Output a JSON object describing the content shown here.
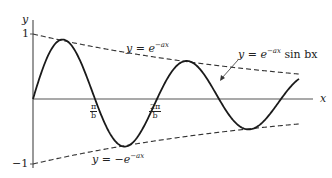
{
  "axes": {
    "x_label": "x",
    "y_label": "y",
    "y_ticks": [
      {
        "value": 1,
        "label": "1"
      },
      {
        "value": -1,
        "label": "−1"
      }
    ],
    "x_ticks": [
      {
        "num": "π",
        "den": "b"
      },
      {
        "num": "2π",
        "den": "b"
      }
    ]
  },
  "curves": {
    "upper_envelope": {
      "prefix": "y = e",
      "exp": "−ax"
    },
    "lower_envelope": {
      "prefix": "y = −e",
      "exp": "−ax"
    },
    "main_curve": {
      "prefix": "y = e",
      "exp": "−ax",
      "suffix": " sin bx"
    }
  },
  "colors": {
    "line": "#222222",
    "axis": "#555555",
    "background": "#ffffff"
  },
  "chart_data": {
    "type": "line",
    "xlabel": "x",
    "ylabel": "y",
    "ylim": [
      -1,
      1
    ],
    "series": [
      {
        "name": "y = e^(−ax) sin bx",
        "style": "solid"
      },
      {
        "name": "y = e^(−ax)",
        "style": "dashed"
      },
      {
        "name": "y = −e^(−ax)",
        "style": "dashed"
      }
    ],
    "x_tick_labels": [
      "π/b",
      "2π/b"
    ],
    "y_tick_labels": [
      "1",
      "−1"
    ]
  }
}
